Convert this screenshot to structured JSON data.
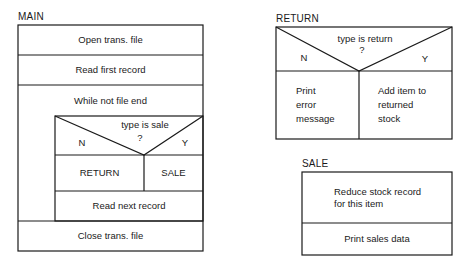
{
  "main": {
    "title": "MAIN",
    "steps": {
      "open": "Open trans. file",
      "read_first": "Read first record",
      "loop": "While not file end",
      "decision": {
        "question": "type is sale",
        "mark": "?",
        "no": "N",
        "yes": "Y",
        "no_branch": "RETURN",
        "yes_branch": "SALE"
      },
      "read_next": "Read next record",
      "close": "Close trans. file"
    }
  },
  "return": {
    "title": "RETURN",
    "decision": {
      "question": "type is return",
      "mark": "?",
      "no": "N",
      "yes": "Y"
    },
    "no_branch": [
      "Print",
      "error",
      "message"
    ],
    "yes_branch": [
      "Add item to",
      "returned",
      "stock"
    ]
  },
  "sale": {
    "title": "SALE",
    "step1": [
      "Reduce stock record",
      "for this item"
    ],
    "step2": "Print sales data"
  },
  "colors": {
    "line": "#1a1a1a",
    "background": "#ffffff"
  }
}
